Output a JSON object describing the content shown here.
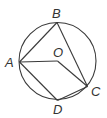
{
  "diagram": {
    "type": "circle-geometry",
    "circle": {
      "center": "O",
      "cx": 57.5,
      "cy": 61,
      "r": 38.5
    },
    "points": {
      "A": {
        "x": 19.5,
        "y": 62,
        "label": "A",
        "lx": 5,
        "ly": 67
      },
      "B": {
        "x": 57,
        "y": 22.5,
        "label": "B",
        "lx": 52,
        "ly": 18
      },
      "C": {
        "x": 87.5,
        "y": 86.5,
        "label": "C",
        "lx": 91,
        "ly": 96
      },
      "D": {
        "x": 57.5,
        "y": 100.5,
        "label": "D",
        "lx": 53,
        "ly": 114
      },
      "O": {
        "x": 57.5,
        "y": 61,
        "label": "O",
        "lx": 53,
        "ly": 57
      }
    },
    "segments": [
      [
        "A",
        "B"
      ],
      [
        "B",
        "C"
      ],
      [
        "A",
        "O"
      ],
      [
        "O",
        "C"
      ],
      [
        "A",
        "D"
      ],
      [
        "D",
        "C"
      ]
    ],
    "colors": {
      "stroke": "#3a3a3a",
      "label": "#333333",
      "background": "#ffffff"
    }
  }
}
